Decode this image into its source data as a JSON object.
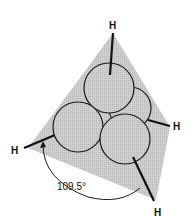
{
  "figure": {
    "atoms": [
      {
        "label": "H",
        "position": "top"
      },
      {
        "label": "H",
        "position": "right"
      },
      {
        "label": "H",
        "position": "left"
      },
      {
        "label": "H",
        "position": "bottom"
      }
    ],
    "angle_label": "109.5°",
    "colors": {
      "plane_fill": "#c9c9c9",
      "circle_fill": "#d2d2d2",
      "stroke": "#1a1a1a",
      "background": "#ffffff"
    }
  }
}
